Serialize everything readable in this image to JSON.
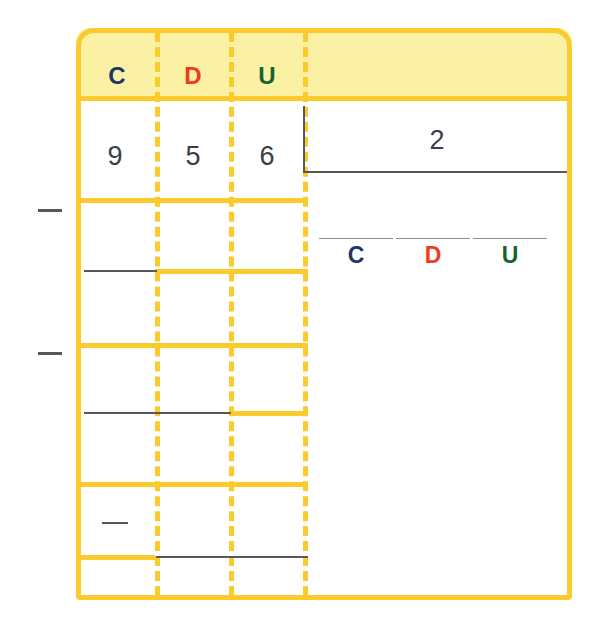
{
  "worksheet": {
    "type": "long-division-place-value-grid",
    "title_columns": [
      {
        "id": "hundreds",
        "label": "C",
        "color": "#1F3566"
      },
      {
        "id": "tens",
        "label": "D",
        "color": "#EE3C1B"
      },
      {
        "id": "units",
        "label": "U",
        "color": "#15632F"
      }
    ],
    "dividend": {
      "digits": [
        "9",
        "5",
        "6"
      ],
      "value": "956"
    },
    "divisor": {
      "value": "2"
    },
    "answer_slots": [
      {
        "label": "C",
        "value": "",
        "color": "#1F3566"
      },
      {
        "label": "D",
        "value": "",
        "color": "#EE3C1B"
      },
      {
        "label": "U",
        "value": "",
        "color": "#15632F"
      }
    ],
    "operator_marks": [
      {
        "name": "minus-sign-step-1",
        "symbol": "−"
      },
      {
        "name": "minus-sign-step-2",
        "symbol": "−"
      },
      {
        "name": "minus-sign-step-3",
        "symbol": "−"
      }
    ],
    "colors": {
      "grid_line": "#FBCB2E",
      "header_fill": "#FAF1A4",
      "work_line": "#55595E",
      "answer_rule": "#8C9097",
      "digit_text": "#3B3F45",
      "page_background": "#FFFFFF"
    },
    "row_rules": [
      {
        "name": "header-bottom-rule",
        "top": 68,
        "left": 0,
        "width": 496
      },
      {
        "name": "dividend-bottom-rule",
        "top": 170,
        "left": 0,
        "width": 232
      },
      {
        "name": "work-row-1-rule",
        "top": 241,
        "left": 79,
        "width": 153
      },
      {
        "name": "work-row-2-rule",
        "top": 315,
        "left": 0,
        "width": 232
      },
      {
        "name": "work-row-3-rule",
        "top": 383,
        "left": 153,
        "width": 79
      },
      {
        "name": "work-row-4-rule",
        "top": 454,
        "left": 0,
        "width": 232
      },
      {
        "name": "work-row-5-rule",
        "top": 527,
        "left": 0,
        "width": 79
      }
    ],
    "work_lines": [
      {
        "name": "remainder-line-1",
        "top": 242,
        "left": 8,
        "width": 73
      },
      {
        "name": "remainder-line-2",
        "top": 384,
        "left": 8,
        "width": 147
      },
      {
        "name": "remainder-line-3",
        "top": 528,
        "left": 80,
        "width": 152
      }
    ]
  }
}
